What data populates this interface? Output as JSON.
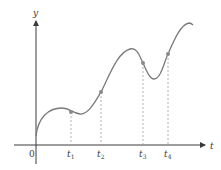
{
  "figure": {
    "y_axis_label": "y",
    "x_axis_label": "t",
    "origin_label": "0",
    "points": [
      {
        "name": "t",
        "sub": "1"
      },
      {
        "name": "t",
        "sub": "2"
      },
      {
        "name": "t",
        "sub": "3"
      },
      {
        "name": "t",
        "sub": "4"
      }
    ],
    "colors": {
      "axis": "#3a3a3a",
      "curve": "#7a7a7a",
      "point": "#8a8a8a",
      "dashed": "#9a9a9a"
    }
  }
}
